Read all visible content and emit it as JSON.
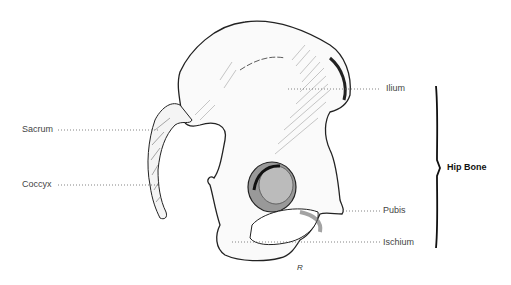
{
  "diagram": {
    "title": "Hip Bone",
    "labels": [
      {
        "id": "ilium",
        "text": "Ilium"
      },
      {
        "id": "sacrum",
        "text": "Sacrum"
      },
      {
        "id": "coccyx",
        "text": "Coccyx"
      },
      {
        "id": "pubis",
        "text": "Pubis"
      },
      {
        "id": "ischium",
        "text": "Ischium"
      }
    ],
    "bracket_label": "Hip Bone",
    "colors": {
      "line": "#222222",
      "shade": "#555555",
      "leader": "#666666"
    }
  }
}
